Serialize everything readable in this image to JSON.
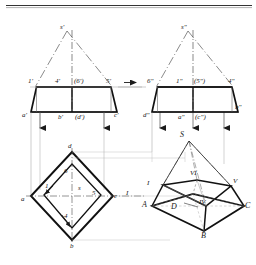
{
  "figure": {
    "type": "technical-drawing",
    "background_color": "#ffffff",
    "ink_color": "#1a1a1a",
    "thin_color": "#9a9a9a",
    "rule_color": "#333333"
  },
  "views": {
    "front": {
      "name": "front-view",
      "apex_label": "s'",
      "upper_labels": [
        "1'",
        "4'",
        "(6')",
        "5'"
      ],
      "lower_labels": [
        "a'",
        "b'",
        "(d')",
        "c'"
      ]
    },
    "side": {
      "name": "side-view",
      "apex_label": "s\"",
      "upper_labels": [
        "6\"",
        "1\"",
        "(5\")",
        "4\""
      ],
      "lower_labels": [
        "d\"",
        "a\"",
        "(c\")",
        "b\""
      ]
    },
    "top": {
      "name": "top-view",
      "vertex_labels": [
        "a",
        "b",
        "c",
        "d"
      ],
      "interior_labels": [
        "1",
        "6",
        "s",
        "5",
        "4"
      ],
      "axis_label": "I"
    },
    "pictorial": {
      "name": "pictorial-view",
      "apex_label": "S",
      "base_labels": [
        "A",
        "B",
        "C",
        "D"
      ],
      "section_labels": [
        "I",
        "VI",
        "V",
        "IV"
      ]
    }
  },
  "markers": {
    "transfer_arrow": "▶",
    "projector_arrow": "▼"
  }
}
